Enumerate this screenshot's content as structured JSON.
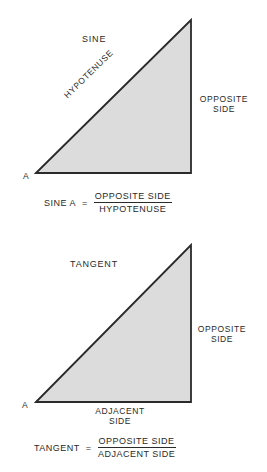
{
  "colors": {
    "fill": "#dcdcdc",
    "stroke": "#2a2a2a",
    "text": "#2a2a2a"
  },
  "panels": [
    {
      "title": "SINE",
      "vertex_label": "A",
      "hypotenuse_label": "HYPOTENUSE",
      "opposite_label_line1": "OPPOSITE",
      "opposite_label_line2": "SIDE",
      "formula": {
        "lhs": "SINE A",
        "eq": "=",
        "numerator": "OPPOSITE SIDE",
        "denominator": "HYPOTENUSE"
      }
    },
    {
      "title": "TANGENT",
      "vertex_label": "A",
      "opposite_label_line1": "OPPOSITE",
      "opposite_label_line2": "SIDE",
      "adjacent_label_line1": "ADJACENT",
      "adjacent_label_line2": "SIDE",
      "formula": {
        "lhs": "TANGENT",
        "eq": "=",
        "numerator": "OPPOSITE SIDE",
        "denominator": "ADJACENT SIDE"
      }
    }
  ]
}
